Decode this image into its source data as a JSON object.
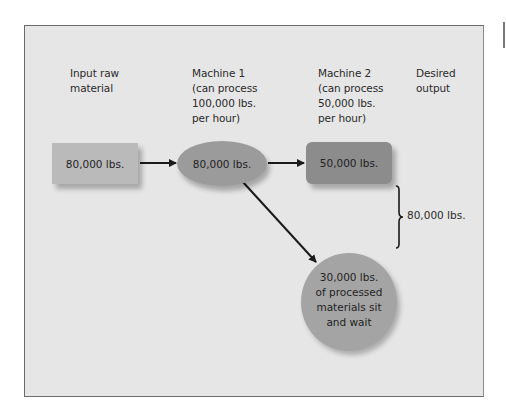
{
  "diagram": {
    "type": "process-flow",
    "columns": [
      {
        "id": "input",
        "label": "Input raw\nmaterial"
      },
      {
        "id": "machine1",
        "label": "Machine 1\n(can process\n100,000 lbs.\nper hour)"
      },
      {
        "id": "machine2",
        "label": "Machine 2\n(can process\n50,000 lbs.\nper hour)"
      },
      {
        "id": "output",
        "label": "Desired\noutput"
      }
    ],
    "nodes": {
      "input_box": {
        "text": "80,000 lbs.",
        "shape": "rectangle",
        "color": "#bababa"
      },
      "machine1_ellipse": {
        "text": "80,000 lbs.",
        "shape": "ellipse",
        "color": "#9b9b9b"
      },
      "machine2_box": {
        "text": "50,000 lbs.",
        "shape": "rounded-rectangle",
        "color": "#8c8c8c"
      },
      "wait_circle": {
        "text": "30,000 lbs.\nof processed\nmaterials sit\nand wait",
        "shape": "circle",
        "color": "#a4a4a4"
      }
    },
    "edges": [
      {
        "from": "input_box",
        "to": "machine1_ellipse"
      },
      {
        "from": "machine1_ellipse",
        "to": "machine2_box"
      },
      {
        "from": "machine1_ellipse",
        "to": "wait_circle"
      }
    ],
    "brace": {
      "text": "80,000 lbs.",
      "spans": [
        "machine2_box",
        "wait_circle"
      ]
    },
    "colors": {
      "background": "#e6e6e6",
      "frame_border": "#6a6a6a",
      "arrow": "#1a1a1a",
      "text": "#2a2a2a"
    }
  }
}
